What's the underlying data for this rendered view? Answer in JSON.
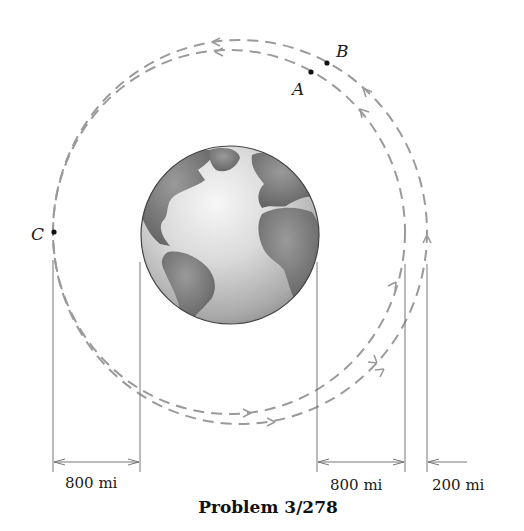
{
  "figure": {
    "caption": "Problem 3/278",
    "points": {
      "A": "A",
      "B": "B",
      "C": "C"
    },
    "dimensions": [
      {
        "label": "800 mi",
        "description": "distance from point C to Earth surface (left)"
      },
      {
        "label": "800 mi",
        "description": "distance from Earth surface to inner orbit (right)"
      },
      {
        "label": "200 mi",
        "description": "gap between inner and outer orbit (right)"
      }
    ],
    "colors": {
      "orbit": "#9a9a9a",
      "dimension_line": "#777777",
      "text": "#1a1a1a",
      "earth_land": "#7a7a7a",
      "earth_ocean": "#d8d8d8"
    }
  }
}
